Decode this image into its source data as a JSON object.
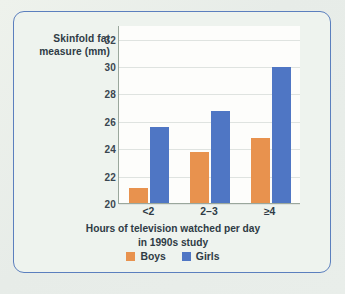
{
  "figure": {
    "border_color": "#5b7fbe",
    "background_color": "#eef3ee",
    "plot_background_color": "#fdfdfb"
  },
  "chart_data": {
    "type": "bar",
    "title": "",
    "subtitle": "",
    "categories": [
      "<2",
      "2–3",
      "≥4"
    ],
    "series": [
      {
        "name": "Boys",
        "color": "#e8924e",
        "values": [
          21.2,
          23.8,
          24.8
        ]
      },
      {
        "name": "Girls",
        "color": "#4f76c4",
        "values": [
          25.6,
          26.8,
          30.0
        ]
      }
    ],
    "xlabel": "Hours of television watched per day in 1990s study",
    "xlabel_line1": "Hours of television watched per day",
    "xlabel_line2": "in 1990s study",
    "ylabel": "Skinfold fat measure (mm)",
    "ylabel_line1": "Skinfold fat",
    "ylabel_line2": "measure (mm)",
    "ylim": [
      20,
      33
    ],
    "yticks": [
      20,
      22,
      24,
      26,
      28,
      30,
      32
    ],
    "ytick_labels": [
      "20",
      "22",
      "24",
      "26",
      "28",
      "30",
      "32"
    ],
    "grid": true,
    "grid_axis": "y",
    "legend_position": "bottom-center",
    "legend_entries": [
      "Boys",
      "Girls"
    ]
  }
}
